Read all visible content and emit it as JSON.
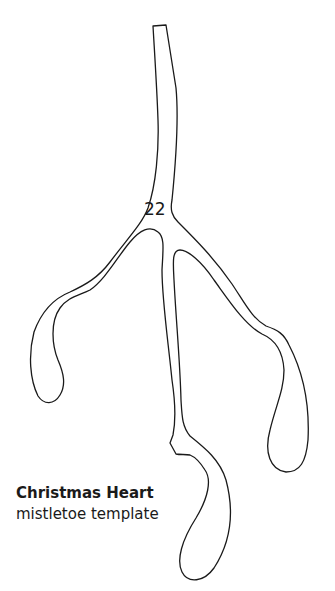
{
  "template": {
    "number": "22",
    "title": "Christmas Heart",
    "subtitle": "mistletoe template",
    "stroke_color": "#1a1a1a"
  }
}
